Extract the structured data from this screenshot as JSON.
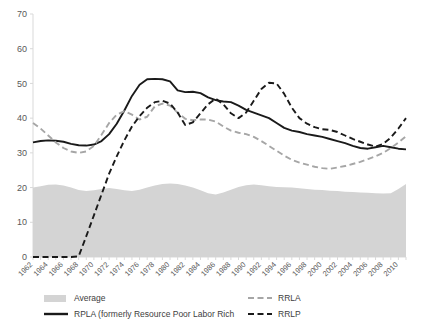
{
  "chart_data": {
    "type": "line",
    "title": "",
    "xlabel": "",
    "ylabel": "",
    "ylim": [
      0,
      70
    ],
    "yticks": [
      0,
      10,
      20,
      30,
      40,
      50,
      60,
      70
    ],
    "grid": false,
    "legend_position": "bottom",
    "x": [
      1962,
      1963,
      1964,
      1965,
      1966,
      1967,
      1968,
      1969,
      1970,
      1971,
      1972,
      1973,
      1974,
      1975,
      1976,
      1977,
      1978,
      1979,
      1980,
      1981,
      1982,
      1983,
      1984,
      1985,
      1986,
      1987,
      1988,
      1989,
      1990,
      1991,
      1992,
      1993,
      1994,
      1995,
      1996,
      1997,
      1998,
      1999,
      2000,
      2001,
      2002,
      2003,
      2004,
      2005,
      2006,
      2007,
      2008,
      2009,
      2010,
      2011
    ],
    "xtick_labels": [
      "1962",
      "1964",
      "1966",
      "1968",
      "1970",
      "1972",
      "1974",
      "1976",
      "1978",
      "1980",
      "1982",
      "1984",
      "1986",
      "1988",
      "1990",
      "1992",
      "1994",
      "1996",
      "1998",
      "2000",
      "2002",
      "2004",
      "2006",
      "2008",
      "2010"
    ],
    "series": [
      {
        "name": "Average",
        "style": "area",
        "color": "#d4d4d4",
        "values": [
          20.0,
          20.4,
          20.8,
          20.9,
          20.6,
          20.0,
          19.3,
          19.0,
          19.2,
          19.6,
          19.9,
          19.6,
          19.2,
          19.0,
          19.4,
          20.0,
          20.6,
          21.0,
          21.2,
          21.0,
          20.6,
          20.0,
          19.2,
          18.4,
          18.0,
          18.6,
          19.4,
          20.2,
          20.7,
          20.9,
          20.7,
          20.4,
          20.2,
          20.1,
          20.0,
          19.8,
          19.6,
          19.4,
          19.3,
          19.1,
          19.0,
          18.8,
          18.7,
          18.6,
          18.5,
          18.4,
          18.3,
          18.4,
          19.6,
          21.0
        ]
      },
      {
        "name": "RPLA (formerly Resource Poor Labor Rich",
        "style": "solid",
        "color": "#1a1a1a",
        "values": [
          33.0,
          33.4,
          33.6,
          33.5,
          33.2,
          32.6,
          32.2,
          32.1,
          32.4,
          33.4,
          35.4,
          38.4,
          42.2,
          46.4,
          49.6,
          51.2,
          51.3,
          51.2,
          50.6,
          48.0,
          47.5,
          47.6,
          47.2,
          46.0,
          45.2,
          44.8,
          44.6,
          43.6,
          42.4,
          41.6,
          40.8,
          40.0,
          38.6,
          37.2,
          36.4,
          36.0,
          35.4,
          35.0,
          34.6,
          34.0,
          33.4,
          32.8,
          32.0,
          31.4,
          31.2,
          31.6,
          32.0,
          31.6,
          31.2,
          31.0
        ]
      },
      {
        "name": "RRLA",
        "style": "dashed",
        "color": "#a6a6a6",
        "values": [
          38.6,
          37.0,
          35.0,
          33.0,
          31.4,
          30.4,
          30.0,
          30.4,
          32.0,
          35.2,
          38.6,
          41.0,
          42.0,
          41.0,
          39.6,
          40.4,
          43.4,
          44.2,
          43.6,
          41.6,
          39.8,
          39.4,
          39.6,
          39.6,
          39.0,
          37.6,
          36.4,
          35.8,
          35.4,
          34.6,
          33.4,
          32.0,
          30.6,
          29.2,
          28.0,
          27.2,
          26.6,
          26.0,
          25.6,
          25.4,
          25.8,
          26.2,
          26.8,
          27.4,
          28.2,
          29.0,
          30.0,
          31.4,
          33.0,
          34.8
        ]
      },
      {
        "name": "RRLP",
        "style": "dashed",
        "color": "#1a1a1a",
        "values": [
          0.0,
          0.0,
          0.0,
          0.0,
          0.0,
          0.0,
          0.2,
          6.0,
          12.0,
          18.0,
          24.0,
          29.0,
          33.6,
          37.6,
          40.6,
          43.0,
          44.6,
          45.0,
          44.2,
          41.6,
          38.0,
          38.8,
          41.4,
          44.0,
          45.6,
          44.0,
          41.4,
          40.0,
          41.6,
          45.0,
          48.4,
          50.2,
          50.0,
          47.0,
          43.0,
          40.0,
          38.4,
          37.4,
          36.8,
          36.6,
          36.0,
          35.0,
          34.0,
          33.2,
          32.4,
          31.8,
          32.6,
          34.4,
          37.0,
          40.0
        ]
      }
    ]
  },
  "legend": {
    "items": [
      {
        "label": "Average",
        "marker": "area-swatch",
        "color": "#d4d4d4"
      },
      {
        "label": "RPLA (formerly Resource Poor Labor Rich",
        "marker": "solid-line",
        "color": "#1a1a1a"
      },
      {
        "label": "RRLA",
        "marker": "dashed-line",
        "color": "#a6a6a6"
      },
      {
        "label": "RRLP",
        "marker": "dashed-line",
        "color": "#1a1a1a"
      }
    ]
  }
}
